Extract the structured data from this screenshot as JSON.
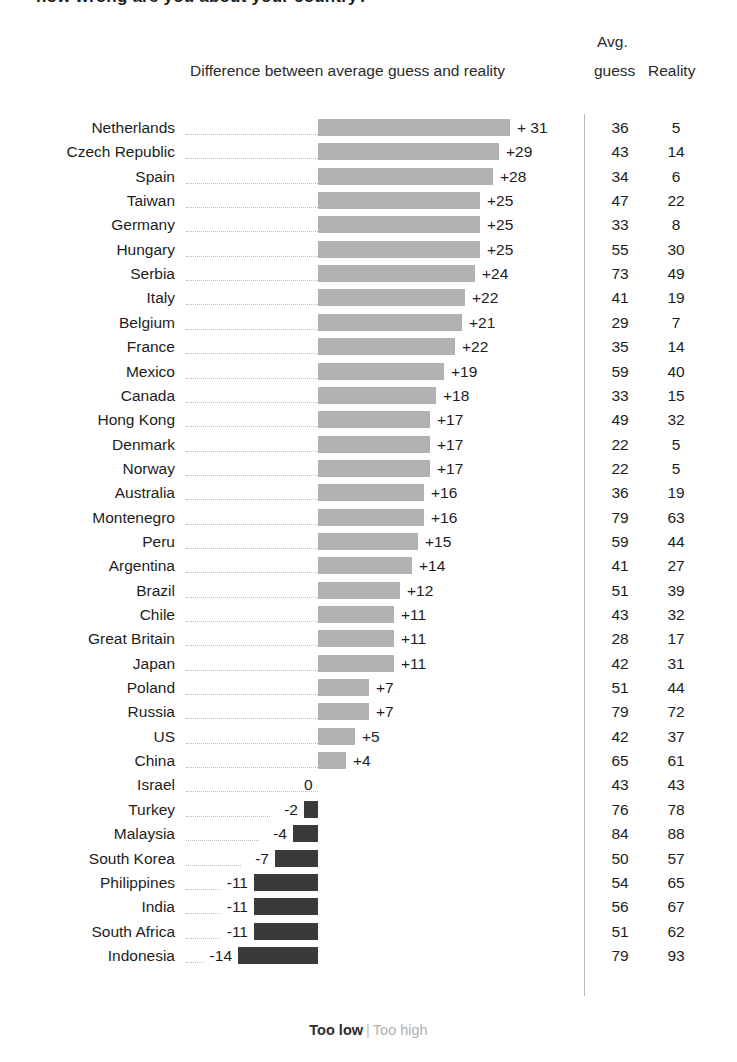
{
  "title": "how wrong are you about your country?",
  "header": {
    "diff_label": "Difference between average guess and reality",
    "avg_label": "Avg.",
    "guess_label": "guess",
    "reality_label": "Reality"
  },
  "legend": {
    "too_low": "Too low",
    "separator": "|",
    "too_high": "Too high"
  },
  "colors": {
    "positive_bar": "#b2b2b2",
    "negative_bar": "#3a3a3a",
    "text": "#1d1d1d",
    "leader": "#bdbdbd",
    "divider": "#b9b9b9"
  },
  "chart_data": {
    "type": "bar",
    "title": "Difference between average guess and reality",
    "xlabel": "",
    "ylabel": "",
    "orientation": "horizontal",
    "baseline": 0,
    "grid": false,
    "legend_position": "bottom",
    "legend_entries": [
      "Too low",
      "Too high"
    ],
    "columns": [
      "Country",
      "Difference",
      "Avg. guess",
      "Reality"
    ],
    "xlim": [
      -14,
      31
    ],
    "categories": [
      "Netherlands",
      "Czech Republic",
      "Spain",
      "Taiwan",
      "Germany",
      "Hungary",
      "Serbia",
      "Italy",
      "Belgium",
      "France",
      "Mexico",
      "Canada",
      "Hong Kong",
      "Denmark",
      "Norway",
      "Australia",
      "Montenegro",
      "Peru",
      "Argentina",
      "Brazil",
      "Chile",
      "Great Britain",
      "Japan",
      "Poland",
      "Russia",
      "US",
      "China",
      "Israel",
      "Turkey",
      "Malaysia",
      "South Korea",
      "Philippines",
      "India",
      "South Africa",
      "Indonesia"
    ],
    "values": [
      31,
      29,
      28,
      25,
      25,
      25,
      24,
      22,
      21,
      22,
      19,
      18,
      17,
      17,
      17,
      16,
      16,
      15,
      14,
      12,
      11,
      11,
      11,
      7,
      7,
      5,
      4,
      0,
      -2,
      -4,
      -7,
      -11,
      -11,
      -11,
      -14
    ],
    "value_labels": [
      "+ 31",
      "+29",
      "+28",
      "+25",
      "+25",
      "+25",
      "+24",
      "+22",
      "+21",
      "+22",
      "+19",
      "+18",
      "+17",
      "+17",
      "+17",
      "+16",
      "+16",
      "+15",
      "+14",
      "+12",
      "+11",
      "+11",
      "+11",
      "+7",
      "+7",
      "+5",
      "+4",
      "0",
      "-2",
      "-4",
      "-7",
      "-11",
      "-11",
      "-11",
      "-14"
    ],
    "series": [
      {
        "name": "Avg. guess",
        "values": [
          36,
          43,
          34,
          47,
          33,
          55,
          73,
          41,
          29,
          35,
          59,
          33,
          49,
          22,
          22,
          36,
          79,
          59,
          41,
          51,
          43,
          28,
          42,
          51,
          79,
          42,
          65,
          43,
          76,
          84,
          50,
          54,
          56,
          51,
          79
        ]
      },
      {
        "name": "Reality",
        "values": [
          5,
          14,
          6,
          22,
          8,
          30,
          49,
          19,
          7,
          14,
          40,
          15,
          32,
          5,
          5,
          19,
          63,
          44,
          27,
          39,
          32,
          17,
          31,
          44,
          72,
          37,
          61,
          43,
          78,
          88,
          57,
          65,
          67,
          62,
          93
        ]
      }
    ],
    "bar_widths_px": [
      192,
      181,
      175,
      162,
      162,
      162,
      157,
      147,
      144,
      137,
      126,
      118,
      112,
      112,
      112,
      106,
      106,
      100,
      94,
      82,
      76,
      76,
      76,
      51,
      51,
      37,
      28,
      0,
      14,
      25,
      43,
      64,
      64,
      64,
      80
    ]
  }
}
